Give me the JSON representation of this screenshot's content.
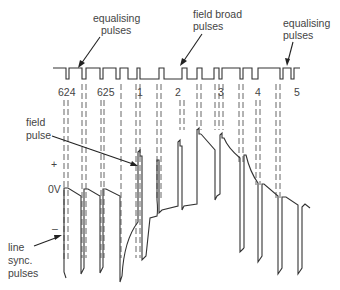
{
  "labels": {
    "equalising_left": [
      "equalising",
      "pulses"
    ],
    "field_broad": [
      "field broad",
      "pulses"
    ],
    "equalising_right": [
      "equalising",
      "pulses"
    ],
    "field_pulse": [
      "field",
      "pulse"
    ],
    "plus": "+",
    "zero_v": "0V",
    "minus": "–",
    "line_sync": [
      "line",
      "sync.",
      "pulses"
    ]
  },
  "line_numbers": [
    "624",
    "625",
    "1",
    "2",
    "3",
    "4",
    "5"
  ],
  "colors": {
    "line": "#333333",
    "text": "#444444",
    "background": "#ffffff"
  }
}
